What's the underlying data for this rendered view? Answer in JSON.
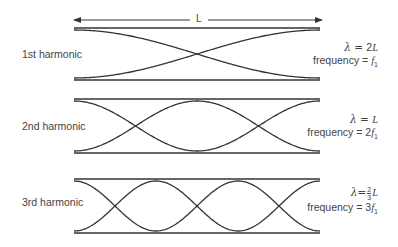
{
  "length_label": "L",
  "harmonics": [
    {
      "name": "1st harmonic",
      "loops": 1,
      "wavelength_prefix": "λ = ",
      "wavelength_coeff": "2",
      "wavelength_var": "L",
      "frequency_prefix": "frequency = ",
      "frequency_coeff": "",
      "frequency_var": "f",
      "frequency_sub": "1"
    },
    {
      "name": "2nd harmonic",
      "loops": 2,
      "wavelength_prefix": "λ = ",
      "wavelength_coeff": "",
      "wavelength_var": "L",
      "frequency_prefix": "frequency = ",
      "frequency_coeff": "2",
      "frequency_var": "f",
      "frequency_sub": "1"
    },
    {
      "name": "3rd harmonic",
      "loops": 3,
      "wavelength_prefix": "λ=",
      "wavelength_frac_num": "2",
      "wavelength_frac_den": "3",
      "wavelength_var": "L",
      "frequency_prefix": "frequency = ",
      "frequency_coeff": "3",
      "frequency_var": "f",
      "frequency_sub": "1"
    }
  ]
}
